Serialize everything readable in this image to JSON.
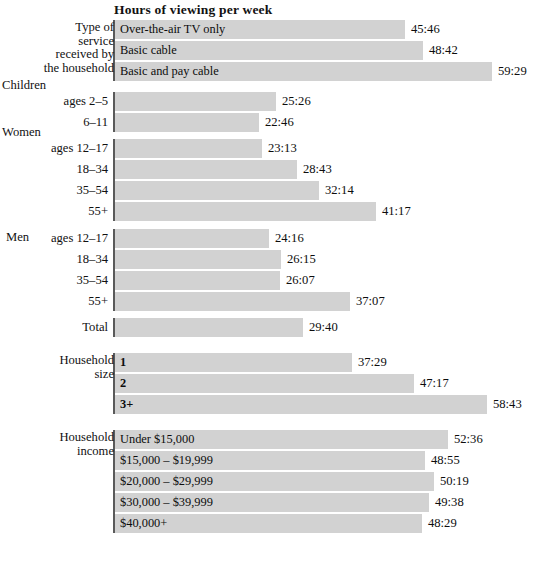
{
  "chart_data": {
    "type": "bar",
    "title": "Hours of viewing per week",
    "xlabel": "",
    "ylabel": "",
    "orientation": "horizontal",
    "grid": false,
    "legend": false,
    "value_format": "hours:minutes",
    "xlim": [
      0,
      60
    ],
    "groups": [
      {
        "group_label": "Type of\nservice\nreceived by\nthe household",
        "group_label_align": "right",
        "label_inside_bar": true,
        "categories": [
          "Over-the-air TV only",
          "Basic cable",
          "Basic and pay cable"
        ],
        "values": [
          "45:46",
          "48:42",
          "59:29"
        ],
        "values_hours": [
          45.77,
          48.7,
          59.48
        ]
      },
      {
        "group_label": "Children",
        "group_label_align": "left",
        "label_inside_bar": false,
        "categories": [
          "ages 2–5",
          "6–11"
        ],
        "values": [
          "25:26",
          "22:46"
        ],
        "values_hours": [
          25.43,
          22.77
        ]
      },
      {
        "group_label": "Women",
        "group_label_align": "left",
        "label_inside_bar": false,
        "categories": [
          "ages 12–17",
          "18–34",
          "35–54",
          "55+"
        ],
        "values": [
          "23:13",
          "28:43",
          "32:14",
          "41:17"
        ],
        "values_hours": [
          23.22,
          28.72,
          32.23,
          41.28
        ]
      },
      {
        "group_label": "Men",
        "group_label_align": "inline-left",
        "label_inside_bar": false,
        "categories": [
          "ages 12–17",
          "18–34",
          "35–54",
          "55+"
        ],
        "values": [
          "24:16",
          "26:15",
          "26:07",
          "37:07"
        ],
        "values_hours": [
          24.27,
          26.25,
          26.12,
          37.12
        ]
      },
      {
        "group_label": "",
        "group_label_align": "right",
        "label_inside_bar": false,
        "categories": [
          "Total"
        ],
        "values": [
          "29:40"
        ],
        "values_hours": [
          29.67
        ]
      },
      {
        "group_label": "Household\nsize",
        "group_label_align": "right",
        "label_inside_bar": true,
        "label_bold": true,
        "categories": [
          "1",
          "2",
          "3+"
        ],
        "values": [
          "37:29",
          "47:17",
          "58:43"
        ],
        "values_hours": [
          37.48,
          47.28,
          58.72
        ]
      },
      {
        "group_label": "Household\nincome",
        "group_label_align": "right",
        "label_inside_bar": true,
        "categories": [
          "Under  $15,000",
          "$15,000 –  $19,999",
          "$20,000 –  $29,999",
          "$30,000 –  $39,999",
          "$40,000+"
        ],
        "values": [
          "52:36",
          "48:55",
          "50:19",
          "49:38",
          "48:29"
        ],
        "values_hours": [
          52.6,
          48.92,
          50.32,
          49.63,
          48.48
        ]
      }
    ]
  },
  "colors": {
    "bar_fill": "#d2d2d2",
    "axis_line": "#5a5a5a",
    "text": "#111111",
    "background": "#ffffff"
  }
}
